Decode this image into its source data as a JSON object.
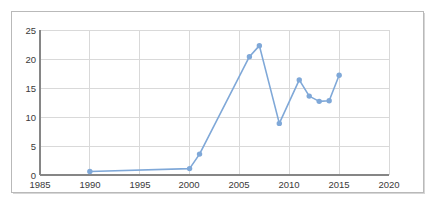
{
  "chart_data": {
    "type": "line",
    "title": "",
    "subtitle": "",
    "xlabel": "",
    "ylabel": "",
    "xlim": [
      1985,
      2020
    ],
    "ylim": [
      0,
      25
    ],
    "xticks": [
      1985,
      1990,
      1995,
      2000,
      2005,
      2010,
      2015,
      2020
    ],
    "yticks": [
      0,
      5,
      10,
      15,
      20,
      25
    ],
    "grid": "horizontal-and-vertical",
    "legend": "none",
    "markers": "circle",
    "series": [
      {
        "name": "series-1",
        "color": "#7FA8D8",
        "x": [
          1990,
          2000,
          2001,
          2006,
          2007,
          2009,
          2011,
          2012,
          2013,
          2014,
          2015
        ],
        "values": [
          0.6,
          1.1,
          3.6,
          20.4,
          22.3,
          8.9,
          16.4,
          13.6,
          12.7,
          12.8,
          17.2
        ]
      }
    ]
  },
  "axis": {
    "y_tick_labels": [
      "25",
      "20",
      "15",
      "10",
      "5",
      "0"
    ],
    "x_tick_labels": [
      "1985",
      "1990",
      "1995",
      "2000",
      "2005",
      "2010",
      "2015",
      "2020"
    ]
  },
  "style": {
    "line_color": "#7FA8D8",
    "marker_color": "#7FA8D8",
    "grid_color": "#d9d9d9",
    "axis_color": "#868686",
    "frame_color": "#b9b9b9",
    "text_color": "#3a3a3a",
    "background": "#ffffff"
  }
}
